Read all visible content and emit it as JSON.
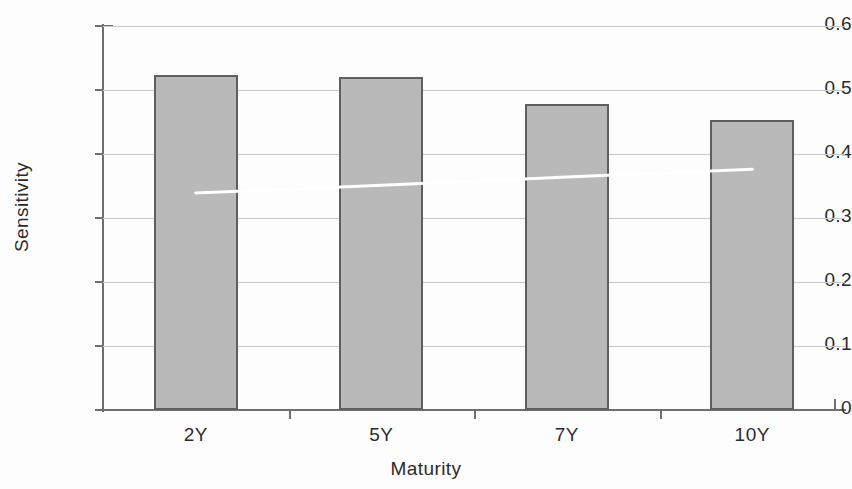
{
  "chart_data": {
    "type": "bar",
    "title": "",
    "subtitle": "",
    "xlabel": "Maturity",
    "ylabel": "Sensitivity",
    "categories": [
      "2Y",
      "5Y",
      "7Y",
      "10Y"
    ],
    "values": [
      0.523,
      0.521,
      0.478,
      0.453
    ],
    "series": [
      {
        "name": "Sensitivity",
        "type": "bar",
        "values": [
          0.523,
          0.521,
          0.478,
          0.453
        ]
      },
      {
        "name": "Trend",
        "type": "line",
        "values": [
          0.339,
          0.351,
          0.364,
          0.376
        ]
      }
    ],
    "ylim": [
      0,
      0.6
    ],
    "ytick_labels": [
      "0.6",
      "0.5",
      "0.4",
      "0.3",
      "0.2",
      "0.1",
      "0"
    ],
    "ytick_values": [
      0.6,
      0.5,
      0.4,
      0.3,
      0.2,
      0.1,
      0
    ],
    "xtick_labels": [
      "2Y",
      "5Y",
      "7Y",
      "10Y"
    ],
    "grid": true,
    "grid_axis": "y",
    "legend": false,
    "legend_position": "none",
    "annotations": [],
    "colors": {
      "bar_fill": "#b9b9b9",
      "bar_edge": "#5f5f5f",
      "trend_line": "#ffffff",
      "gridline": "#c9c9c9",
      "axis": "#6f6f6f",
      "text": "#2b2b2b",
      "background": "#fdfdfd"
    }
  }
}
